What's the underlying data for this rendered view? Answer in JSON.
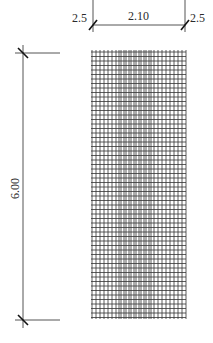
{
  "drawing": {
    "type": "mesh-reinforcement-plan",
    "dimensions": {
      "top_left_offset": "2.5",
      "top_width": "2.10",
      "top_right_offset": "2.5",
      "left_height": "6.00"
    },
    "colors": {
      "background": "#ffffff",
      "lines": "#555555",
      "grid": "#333333",
      "text": "#2a2a2a"
    },
    "grid": {
      "x_left": 91,
      "x_right": 186,
      "y_top": 50,
      "y_bottom": 319,
      "vertical_lines_x": [
        92,
        96,
        100,
        104,
        108,
        112,
        116,
        119,
        121,
        124,
        126,
        129,
        131,
        134,
        136,
        139,
        141,
        144,
        146,
        149,
        151,
        154,
        158,
        162,
        166,
        170,
        174,
        178,
        182,
        186
      ],
      "horizontal_spacing": 4.5
    }
  }
}
